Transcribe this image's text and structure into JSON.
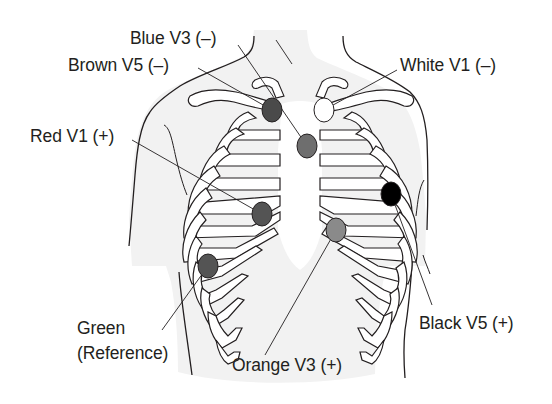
{
  "diagram": {
    "type": "ecg-electrode-placement",
    "colors": {
      "skin_fill": "#f2f2f2",
      "outline": "#231f20",
      "rib_fill": "#ffffff",
      "text": "#231f20"
    },
    "electrodes": [
      {
        "id": "brown-v5-neg",
        "label": "Brown V5 (–)",
        "fill": "#4a4a4a",
        "cx": 272,
        "cy": 110,
        "rx": 10,
        "ry": 12
      },
      {
        "id": "white-v1-neg",
        "label": "White V1 (–)",
        "fill": "#ffffff",
        "cx": 324,
        "cy": 110,
        "rx": 10,
        "ry": 12
      },
      {
        "id": "blue-v3-neg",
        "label": "Blue V3 (–)",
        "fill": "#6e6e6e",
        "cx": 307,
        "cy": 146,
        "rx": 10,
        "ry": 12
      },
      {
        "id": "black-v5-pos",
        "label": "Black V5 (+)",
        "fill": "#000000",
        "cx": 391,
        "cy": 194,
        "rx": 10,
        "ry": 12
      },
      {
        "id": "red-v1-pos",
        "label": "Red V1 (+)",
        "fill": "#545454",
        "cx": 262,
        "cy": 214,
        "rx": 10,
        "ry": 12
      },
      {
        "id": "orange-v3-pos",
        "label": "Orange V3 (+)",
        "fill": "#8a8a8a",
        "cx": 336,
        "cy": 230,
        "rx": 10,
        "ry": 12
      },
      {
        "id": "green-reference",
        "label": "Green (Reference)",
        "fill": "#545454",
        "cx": 208,
        "cy": 266,
        "rx": 10,
        "ry": 12
      }
    ],
    "labels": {
      "blue_v3": "Blue V3 (–)",
      "brown_v5": "Brown V5 (–)",
      "white_v1": "White V1 (–)",
      "red_v1": "Red V1 (+)",
      "green_line1": "Green",
      "green_line2": "(Reference)",
      "orange_v3": "Orange V3 (+)",
      "black_v5": "Black V5 (+)"
    }
  }
}
